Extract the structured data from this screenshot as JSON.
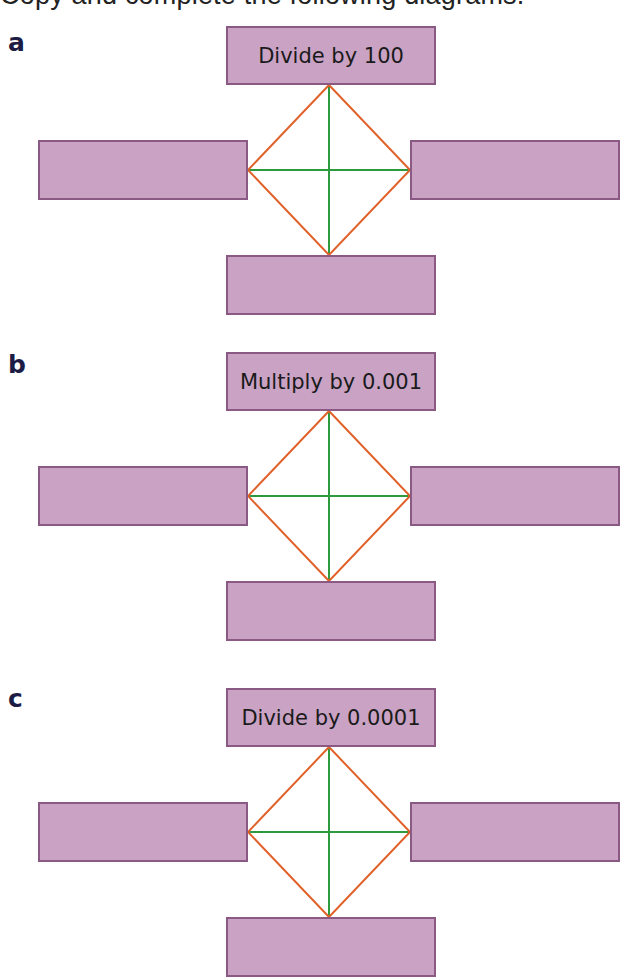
{
  "title": "Copy and complete the following diagrams.",
  "colors": {
    "box_fill": "#c9a2c4",
    "box_border": "#8a5a84",
    "diamond_edge": "#e0622a",
    "cross_line": "#2e9a3e",
    "label_color": "#1c1c44"
  },
  "parts": [
    {
      "label": "a",
      "top_box": "Divide by 100",
      "left_box": "",
      "right_box": "",
      "bottom_box": ""
    },
    {
      "label": "b",
      "top_box": "Multiply by 0.001",
      "left_box": "",
      "right_box": "",
      "bottom_box": ""
    },
    {
      "label": "c",
      "top_box": "Divide by 0.0001",
      "left_box": "",
      "right_box": "",
      "bottom_box": ""
    }
  ]
}
